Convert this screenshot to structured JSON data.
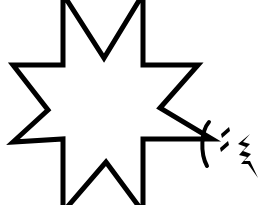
{
  "canvas": {
    "width": 278,
    "height": 205,
    "background_color": "#ffffff",
    "ink_color": "#000000",
    "title": "Eight-pointed star outline with handwritten marks"
  },
  "figure": {
    "name": "eight-pointed-star",
    "fill_color": "#ffffff",
    "stroke_color": "#000000",
    "stroke_width": 4,
    "points": 8,
    "outline_path": "M 63 12 L 63 2 L 63 12 L 104 58 L 143 12 L 143 2 L 143 12 L 143 65 L 198 65 L 198 65 L 160 108 L 199 139 L 206 139 L 199 139 L 143 139 L 143 196 L 143 204 L 143 196 L 106 162 L 63 196 L 63 204 L 63 196 L 63 139 L 13 142 L 48 110 L 13 65 L 63 65 Z",
    "vertices": [
      {
        "name": "top-left-point-tip",
        "x": 63,
        "y": 2
      },
      {
        "name": "top-inner-valley",
        "x": 104,
        "y": 58
      },
      {
        "name": "top-right-point-tip",
        "x": 143,
        "y": 2
      },
      {
        "name": "right-upper-inner",
        "x": 143,
        "y": 65
      },
      {
        "name": "right-upper-point-tip",
        "x": 198,
        "y": 65
      },
      {
        "name": "right-inner-valley",
        "x": 160,
        "y": 108
      },
      {
        "name": "right-lower-point-tip",
        "x": 206,
        "y": 139
      },
      {
        "name": "right-lower-inner",
        "x": 143,
        "y": 139
      },
      {
        "name": "bottom-right-point-tip",
        "x": 143,
        "y": 204
      },
      {
        "name": "bottom-inner-valley",
        "x": 106,
        "y": 162
      },
      {
        "name": "bottom-left-point-tip",
        "x": 63,
        "y": 204
      },
      {
        "name": "left-lower-inner",
        "x": 63,
        "y": 139
      },
      {
        "name": "left-lower-point-tip",
        "x": 13,
        "y": 142
      },
      {
        "name": "left-inner-valley",
        "x": 48,
        "y": 110
      },
      {
        "name": "left-upper-point-tip",
        "x": 13,
        "y": 65
      },
      {
        "name": "left-upper-inner",
        "x": 63,
        "y": 65
      }
    ]
  },
  "marks": [
    {
      "name": "parenthesis-mark",
      "glyph": "(",
      "description": "Open parenthesis arc curving to the left, drawn just right of the star's lower-right point",
      "color": "#000000",
      "bbox": {
        "x": 200,
        "y": 122,
        "width": 12,
        "height": 44
      }
    },
    {
      "name": "upper-dot-mark",
      "glyph": ".",
      "description": "Upper slanted dot of a colon-like pair",
      "color": "#000000",
      "bbox": {
        "x": 220,
        "y": 128,
        "width": 10,
        "height": 7
      }
    },
    {
      "name": "lower-dot-mark",
      "glyph": ".",
      "description": "Lower slanted dot of a colon-like pair",
      "color": "#000000",
      "bbox": {
        "x": 219,
        "y": 142,
        "width": 10,
        "height": 7
      }
    },
    {
      "name": "zigzag-mark",
      "glyph": "⚡",
      "description": "Zigzag lightning-bolt-like stroke trailing down to the right",
      "color": "#000000",
      "bbox": {
        "x": 237,
        "y": 134,
        "width": 22,
        "height": 45
      }
    }
  ]
}
